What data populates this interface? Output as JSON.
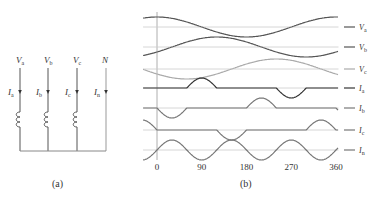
{
  "figure_a": {
    "caption": "(a)",
    "conductors": [
      {
        "top_label": "V",
        "top_sub": "a",
        "current_label": "I",
        "current_sub": "a",
        "has_coil": true
      },
      {
        "top_label": "V",
        "top_sub": "b",
        "current_label": "I",
        "current_sub": "b",
        "has_coil": true
      },
      {
        "top_label": "V",
        "top_sub": "c",
        "current_label": "I",
        "current_sub": "c",
        "has_coil": true
      },
      {
        "top_label": "N",
        "top_sub": "",
        "current_label": "I",
        "current_sub": "n",
        "has_coil": false
      }
    ]
  },
  "figure_b": {
    "caption": "(b)",
    "x_ticks": [
      "0",
      "90",
      "180",
      "270",
      "360"
    ],
    "traces": [
      {
        "label": "V",
        "sub": "a",
        "color": "#555555"
      },
      {
        "label": "V",
        "sub": "b",
        "color": "#555555"
      },
      {
        "label": "V",
        "sub": "c",
        "color": "#aaaaaa"
      },
      {
        "label": "I",
        "sub": "a",
        "color": "#333333"
      },
      {
        "label": "I",
        "sub": "b",
        "color": "#777777"
      },
      {
        "label": "I",
        "sub": "c",
        "color": "#777777"
      },
      {
        "label": "I",
        "sub": "n",
        "color": "#777777"
      }
    ]
  },
  "colors": {
    "line": "#555555",
    "grid": "#cccccc",
    "text": "#333333"
  }
}
